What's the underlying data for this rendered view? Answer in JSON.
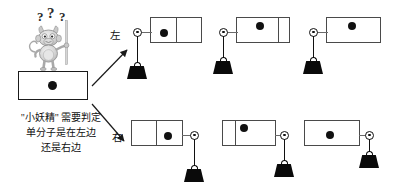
{
  "figure": {
    "title_concept": "maxwell-demon-single-molecule-engine",
    "labels": {
      "left": "左",
      "right": "右"
    },
    "caption_lines": [
      "\"小妖精\" 需要判定",
      "单分子是在左边",
      "还是右边"
    ],
    "question_marks": [
      "?",
      "?",
      "?"
    ],
    "colors": {
      "molecule": "#111111",
      "weight": "#0a0a0a",
      "chamber_stroke": "#4a4a4a",
      "demon_fill": "#cfcfcf",
      "background": "#ffffff"
    }
  },
  "demon_box": {
    "name": "初始容器",
    "molecule_side": "center"
  },
  "left_branch": {
    "label": "左",
    "stages": [
      {
        "stage": 1,
        "divider": true,
        "divider_position_pct": 50,
        "molecule_side": "left",
        "molecule_position_pct": 25,
        "piston": true,
        "pulley_side": "left",
        "weight": "low"
      },
      {
        "stage": 2,
        "divider": true,
        "divider_position_pct": 80,
        "molecule_side": "left",
        "molecule_position_pct": 45,
        "piston": true,
        "pulley_side": "left",
        "weight": "high"
      },
      {
        "stage": 3,
        "divider": false,
        "divider_position_pct": 0,
        "molecule_side": "full",
        "molecule_position_pct": 42,
        "piston": true,
        "pulley_side": "left",
        "weight": "high"
      }
    ]
  },
  "right_branch": {
    "label": "右",
    "stages": [
      {
        "stage": 1,
        "divider": true,
        "divider_position_pct": 48,
        "molecule_side": "right",
        "molecule_position_pct": 72,
        "piston": true,
        "pulley_side": "right",
        "weight": "low"
      },
      {
        "stage": 2,
        "divider": true,
        "divider_position_pct": 24,
        "molecule_side": "right",
        "molecule_position_pct": 42,
        "piston": true,
        "pulley_side": "right",
        "weight": "high"
      },
      {
        "stage": 3,
        "divider": false,
        "divider_position_pct": 0,
        "molecule_side": "full",
        "molecule_position_pct": 45,
        "piston": true,
        "pulley_side": "right",
        "weight": "high"
      }
    ]
  }
}
